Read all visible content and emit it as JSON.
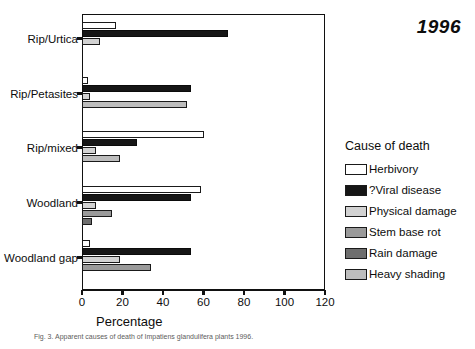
{
  "year_title": "1996",
  "axis": {
    "x_title": "Percentage",
    "x_ticks": [
      0,
      20,
      40,
      60,
      80,
      100,
      120
    ],
    "x_min": 0,
    "x_max": 120
  },
  "legend": {
    "title": "Cause of death",
    "entries": [
      {
        "label": "Herbivory",
        "color": "#ffffff",
        "key": "herbivory"
      },
      {
        "label": "?Viral disease",
        "color": "#161616",
        "key": "viral"
      },
      {
        "label": "Physical damage",
        "color": "#d2d2d2",
        "key": "physical"
      },
      {
        "label": "Stem base rot",
        "color": "#9a9a9a",
        "key": "stem"
      },
      {
        "label": "Rain damage",
        "color": "#6e6e6e",
        "key": "rain"
      },
      {
        "label": "Heavy shading",
        "color": "#bdbdbd",
        "key": "heavy"
      }
    ]
  },
  "caption": "Fig. 3. Apparent causes of death of Impatiens glandulifera plants 1996.",
  "chart_data": {
    "type": "bar",
    "orientation": "horizontal",
    "title": "1996",
    "xlabel": "Percentage",
    "ylabel": "",
    "xlim": [
      0,
      120
    ],
    "grid": false,
    "legend_position": "right",
    "legend_title": "Cause of death",
    "categories": [
      "Rip/Urtica",
      "Rip/Petasites",
      "Rip/mixed",
      "Woodland",
      "Woodland gap"
    ],
    "series": [
      {
        "name": "Herbivory",
        "values": [
          17,
          3,
          60,
          59,
          4
        ]
      },
      {
        "name": "?Viral disease",
        "values": [
          72,
          54,
          27,
          54,
          54
        ]
      },
      {
        "name": "Physical damage",
        "values": [
          9,
          4,
          7,
          7,
          19
        ]
      },
      {
        "name": "Stem base rot",
        "values": [
          0,
          0,
          0,
          15,
          34
        ]
      },
      {
        "name": "Rain damage",
        "values": [
          0,
          0,
          0,
          5,
          0
        ]
      },
      {
        "name": "Heavy shading",
        "values": [
          0,
          52,
          19,
          0,
          0
        ]
      }
    ]
  }
}
